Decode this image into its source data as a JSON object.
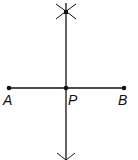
{
  "diagram": {
    "points": [
      {
        "label": "A",
        "x": 9,
        "y": 88
      },
      {
        "label": "P",
        "x": 66,
        "y": 88
      },
      {
        "label": "B",
        "x": 124,
        "y": 88
      }
    ],
    "segment": {
      "from": "A",
      "to": "B"
    },
    "bisector": {
      "x": 66,
      "y1": 0,
      "y2": 160
    },
    "arc_intersections": [
      {
        "x": 66,
        "y": 12
      },
      {
        "x": 66,
        "y": 158
      }
    ],
    "colors": {
      "line": "#111111",
      "background": "#ffffff"
    }
  }
}
